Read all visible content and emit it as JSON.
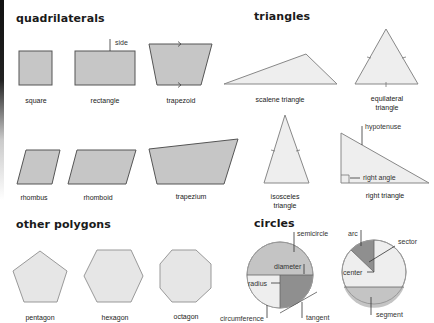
{
  "colors": {
    "quad_fill": "#c6c6c6",
    "quad_stroke": "#555555",
    "tri_fill": "#eeeeee",
    "tri_stroke": "#888888",
    "poly_fill": "#e6e6e6",
    "circle_light": "#eeeeee",
    "circle_mid": "#c4c4c4",
    "circle_dark": "#8f8f8f"
  },
  "sections": {
    "quadrilaterals": {
      "title": "quadrilaterals",
      "shapes": [
        {
          "name": "square"
        },
        {
          "name": "rectangle",
          "annotation": "side"
        },
        {
          "name": "trapezoid"
        },
        {
          "name": "rhombus"
        },
        {
          "name": "rhomboid"
        },
        {
          "name": "trapezium"
        }
      ]
    },
    "triangles": {
      "title": "triangles",
      "shapes": [
        {
          "name": "scalene triangle"
        },
        {
          "name": "equilateral",
          "name2": "triangle"
        },
        {
          "name": "isosceles",
          "name2": "triangle"
        },
        {
          "name": "right triangle",
          "annotations": [
            "hypotenuse",
            "right angle"
          ]
        }
      ]
    },
    "other_polygons": {
      "title": "other polygons",
      "shapes": [
        {
          "name": "pentagon"
        },
        {
          "name": "hexagon"
        },
        {
          "name": "octagon"
        }
      ]
    },
    "circles": {
      "title": "circles",
      "annotations": {
        "semicircle": "semicircle",
        "diameter": "diameter",
        "radius": "radius",
        "circumference": "circumference",
        "tangent": "tangent",
        "arc": "arc",
        "sector": "sector",
        "center": "center",
        "segment": "segment"
      }
    }
  }
}
